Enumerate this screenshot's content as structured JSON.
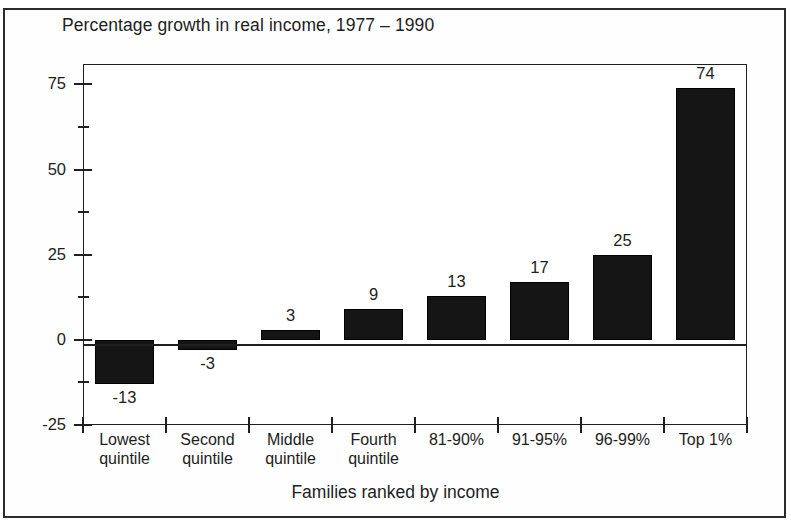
{
  "figure": {
    "title": "Percentage growth in real income, 1977 – 1990",
    "x_axis_title": "Families ranked by income",
    "frame_color": "#2b2b2b",
    "bar_color": "#151515",
    "background": "#ffffff"
  },
  "chart_data": {
    "type": "bar",
    "title": "Percentage growth in real income, 1977 – 1990",
    "xlabel": "Families ranked by income",
    "ylabel": "",
    "categories": [
      "Lowest quintile",
      "Second quintile",
      "Middle quintile",
      "Fourth quintile",
      "81-90%",
      "91-95%",
      "96-99%",
      "Top 1%"
    ],
    "category_lines": [
      [
        "Lowest",
        "quintile"
      ],
      [
        "Second",
        "quintile"
      ],
      [
        "Middle",
        "quintile"
      ],
      [
        "Fourth",
        "quintile"
      ],
      [
        "81-90%",
        ""
      ],
      [
        "91-95%",
        ""
      ],
      [
        "96-99%",
        ""
      ],
      [
        "Top 1%",
        ""
      ]
    ],
    "values": [
      -13,
      -3,
      3,
      9,
      13,
      17,
      25,
      74
    ],
    "value_labels": [
      "-13",
      "-3",
      "3",
      "9",
      "13",
      "17",
      "25",
      "74"
    ],
    "ylim": [
      -25,
      81
    ],
    "ytick_labels": [
      "-25",
      "0",
      "25",
      "50",
      "75"
    ],
    "ytick_values": [
      -25,
      0,
      25,
      50,
      75
    ],
    "yminor_values": [
      -12.5,
      12.5,
      37.5,
      62.5
    ],
    "grid": false,
    "legend": null,
    "series_name": "Percentage growth in real income"
  }
}
